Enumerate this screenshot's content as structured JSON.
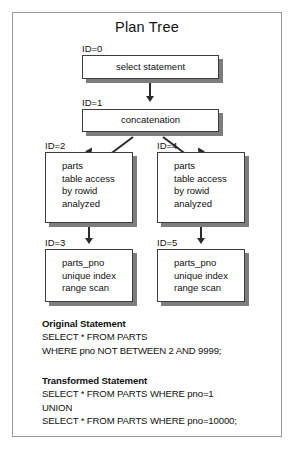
{
  "figure": {
    "title": "Plan Tree",
    "border_color": "#9a9a9a",
    "background": "#ffffff"
  },
  "plan_tree": {
    "node_border_color": "#3d3d3d",
    "node_shadow_color": "#7d7d7d",
    "connector_color": "#2b2b2b",
    "nodes": [
      {
        "id_label": "ID=0",
        "lines": [
          "select statement"
        ],
        "align": "center"
      },
      {
        "id_label": "ID=1",
        "lines": [
          "concatenation"
        ],
        "align": "center"
      },
      {
        "id_label": "ID=2",
        "lines": [
          "parts",
          "table access",
          "by rowid",
          "analyzed"
        ],
        "align": "left"
      },
      {
        "id_label": "ID=4",
        "lines": [
          "parts",
          "table access",
          "by rowid",
          "analyzed"
        ],
        "align": "left"
      },
      {
        "id_label": "ID=3",
        "lines": [
          "parts_pno",
          "unique index",
          "range scan"
        ],
        "align": "left"
      },
      {
        "id_label": "ID=5",
        "lines": [
          "parts_pno",
          "unique index",
          "range scan"
        ],
        "align": "left"
      }
    ]
  },
  "statements": {
    "original": {
      "heading": "Original Statement",
      "lines": [
        "SELECT * FROM PARTS",
        "WHERE pno NOT BETWEEN 2 AND 9999;"
      ]
    },
    "transformed": {
      "heading": "Transformed Statement",
      "lines": [
        "SELECT * FROM PARTS WHERE pno=1",
        "UNION",
        "SELECT * FROM PARTS WHERE pno=10000;"
      ]
    }
  }
}
